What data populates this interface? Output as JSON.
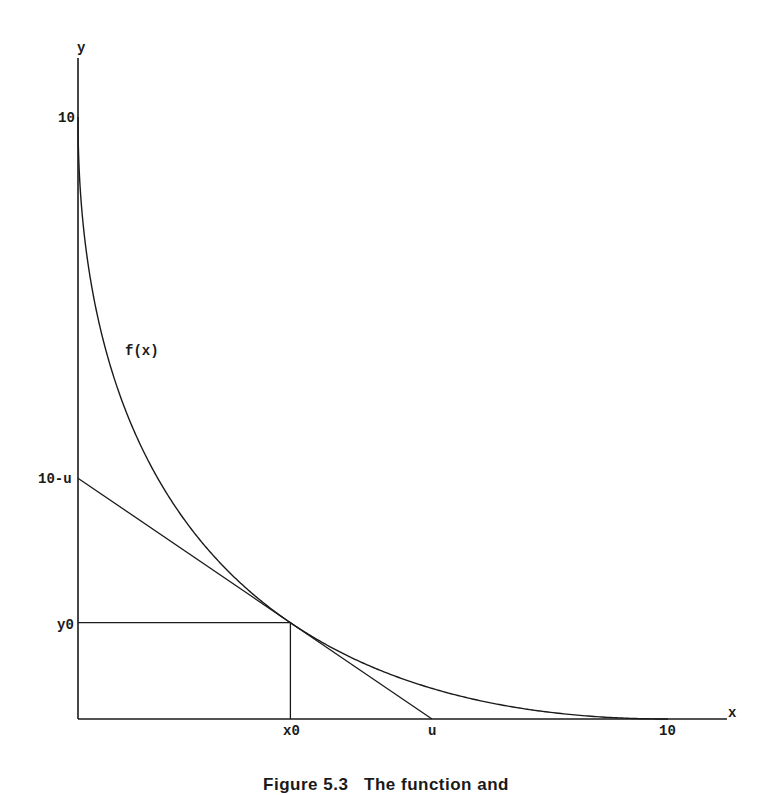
{
  "chart_data": {
    "type": "line",
    "title": "",
    "xlabel": "x",
    "ylabel": "y",
    "xlim": [
      0,
      10
    ],
    "ylim": [
      0,
      10
    ],
    "grid": false,
    "legend": null,
    "x_ticks": [
      {
        "value": 3.6,
        "label": "x0"
      },
      {
        "value": 6,
        "label": "u"
      },
      {
        "value": 10,
        "label": "10"
      }
    ],
    "y_ticks": [
      {
        "value": 10,
        "label": "10"
      },
      {
        "value": 4,
        "label": "10-u"
      },
      {
        "value": 1.6,
        "label": "y0"
      }
    ],
    "series": [
      {
        "name": "f(x)",
        "description": "curve sqrt(x) + sqrt(y) = sqrt(10)",
        "x": [
          0,
          0.1,
          0.25,
          0.5,
          1,
          1.5,
          2,
          2.5,
          3,
          3.6,
          4,
          5,
          6,
          7,
          8,
          9,
          10
        ],
        "y": [
          10,
          8.1,
          7.09,
          5.97,
          4.68,
          3.75,
          3.0,
          2.5,
          1.99,
          1.6,
          1.35,
          0.86,
          0.49,
          0.22,
          0.06,
          0.01,
          0
        ]
      },
      {
        "name": "tangent",
        "description": "tangent line to f at (x0, y0) with intercepts u and 10-u",
        "x": [
          0,
          6
        ],
        "y": [
          4,
          0
        ]
      }
    ],
    "annotations": [
      {
        "text": "f(x)",
        "x": 0.82,
        "y": 6.2
      },
      {
        "text": "tangent point (x0, y0)",
        "x": 3.6,
        "y": 1.6
      }
    ],
    "guides": [
      {
        "type": "horizontal",
        "from": [
          0,
          1.6
        ],
        "to": [
          3.6,
          1.6
        ]
      },
      {
        "type": "vertical",
        "from": [
          3.6,
          0
        ],
        "to": [
          3.6,
          1.6
        ]
      }
    ]
  },
  "labels": {
    "x_axis": "x",
    "y_axis": "y",
    "curve": "f(x)",
    "x0": "x0",
    "u": "u",
    "x10": "10",
    "y10": "10",
    "y_intercept": "10-u",
    "y0": "y0"
  },
  "caption": "Figure 5.3   The function and"
}
